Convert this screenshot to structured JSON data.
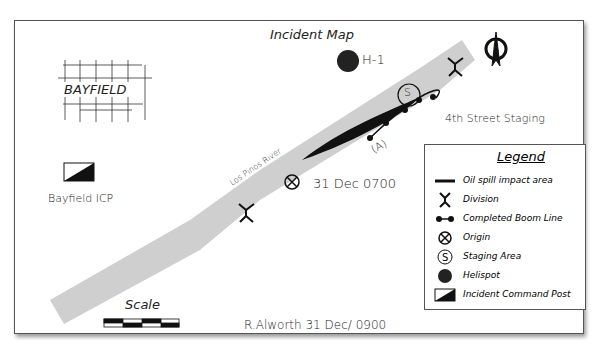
{
  "title": "Incident Map",
  "town": "BAYFIELD",
  "river_label": "Los Pinos River",
  "helispot_label": "H-1",
  "staging_label": "4th Street Staging",
  "staging_symbol": "S",
  "origin_label": "31 Dec 0700",
  "area_marker": "(A)",
  "icp_label": "Bayfield ICP",
  "north_symbol": "N",
  "scale_label": "Scale",
  "footer": "R.Alworth 31 Dec/ 0900",
  "legend": {
    "title": "Legend",
    "items": [
      {
        "icon": "oil-spill-line-icon",
        "label": "Oil spill impact area"
      },
      {
        "icon": "division-icon",
        "label": "Division"
      },
      {
        "icon": "boom-line-icon",
        "label": "Completed Boom Line"
      },
      {
        "icon": "origin-icon",
        "label": "Origin"
      },
      {
        "icon": "staging-icon",
        "label": "Staging Area"
      },
      {
        "icon": "helispot-icon",
        "label": "Helispot"
      },
      {
        "icon": "icp-icon",
        "label": "Incident Command Post"
      }
    ]
  },
  "colors": {
    "river": "#cfcfcf",
    "ink": "#1a1a1a",
    "border": "#555555"
  }
}
